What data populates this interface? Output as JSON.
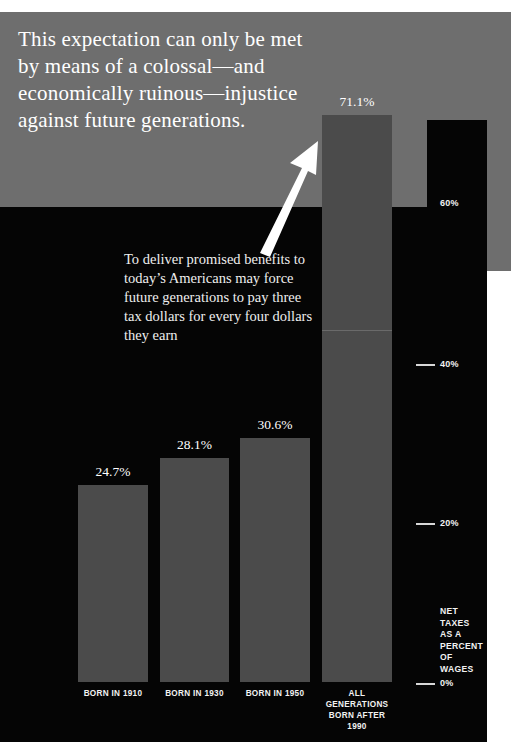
{
  "headline": "This expectation can only be met by means of a colossal—and economically ruinous—injustice against future generations.",
  "caption": "To deliver promised benefits to today’s Americans may force future generations to pay three tax dollars for every four dollars they earn",
  "axis_caption": "NET\nTAXES\nAS A\nPERCENT\nOF\nWAGES",
  "colors": {
    "band_gray": "#6e6e6e",
    "field_black": "#050505",
    "bar_gray": "#4b4b4b",
    "text_white": "#ffffff"
  },
  "chart_data": {
    "type": "bar",
    "title": "",
    "xlabel": "",
    "ylabel": "NET TAXES AS A PERCENT OF WAGES",
    "ylim": [
      0,
      80
    ],
    "grid": false,
    "legend": "none",
    "categories": [
      "BORN IN 1910",
      "BORN IN 1930",
      "BORN IN 1950",
      "ALL GENERATIONS BORN AFTER 1990"
    ],
    "values": [
      24.7,
      28.1,
      30.6,
      71.1
    ],
    "value_labels": [
      "24.7%",
      "28.1%",
      "30.6%",
      "71.1%"
    ],
    "yticks": [
      0,
      20,
      40,
      60
    ],
    "ytick_labels": [
      "0%",
      "20%",
      "40%",
      "60%"
    ]
  },
  "bars": [
    {
      "label": "24.7%",
      "xlabel": "BORN IN 1910",
      "left": 78,
      "width": 70,
      "height": 197
    },
    {
      "label": "28.1%",
      "xlabel": "BORN IN 1930",
      "left": 160,
      "width": 69,
      "height": 224
    },
    {
      "label": "30.6%",
      "xlabel": "BORN IN 1950",
      "left": 240,
      "width": 70,
      "height": 244
    },
    {
      "label": "71.1%",
      "xlabel": "ALL\nGENERATIONS\nBORN AFTER\n1990",
      "left": 322,
      "width": 70,
      "height": 567
    }
  ],
  "yaxis": [
    {
      "text": "60%",
      "top": 198,
      "tick": false
    },
    {
      "text": "40%",
      "top": 359,
      "tick": true
    },
    {
      "text": "20%",
      "top": 518,
      "tick": true
    },
    {
      "text": "0%",
      "top": 678,
      "tick": true
    }
  ]
}
